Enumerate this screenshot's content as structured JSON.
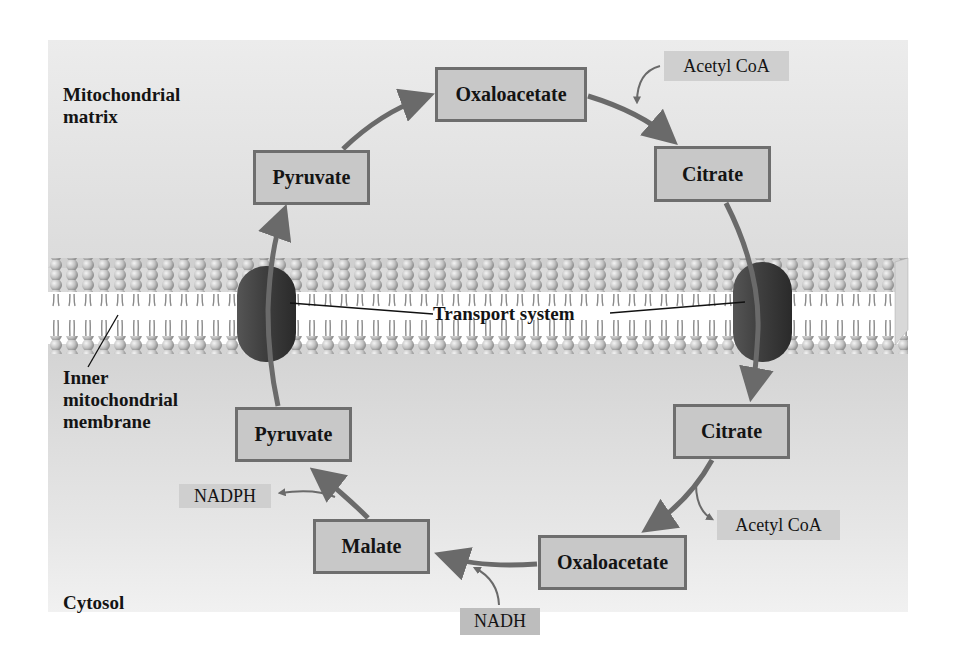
{
  "regions": {
    "matrix": {
      "line1": "Mitochondrial",
      "line2": "matrix"
    },
    "membrane": {
      "line1": "Inner",
      "line2": "mitochondrial",
      "line3": "membrane"
    },
    "cytosol": "Cytosol"
  },
  "transport_label": "Transport system",
  "nodes": {
    "oxaloacetate_matrix": "Oxaloacetate",
    "citrate_matrix": "Citrate",
    "pyruvate_matrix": "Pyruvate",
    "citrate_cytosol": "Citrate",
    "oxaloacetate_cytosol": "Oxaloacetate",
    "malate_cytosol": "Malate",
    "pyruvate_cytosol": "Pyruvate"
  },
  "cofactors": {
    "acetyl_coa_in": "Acetyl CoA",
    "acetyl_coa_out": "Acetyl CoA",
    "nadh_in": "NADH",
    "nadph_out": "NADPH"
  },
  "colors": {
    "box_fill": "#c8c8c8",
    "box_border": "#6e6e6e",
    "arrow": "#6a6a6a",
    "protein": "#3c3c3c",
    "lipid_head": "#bdbdbd",
    "background": "#dcdcdc"
  }
}
